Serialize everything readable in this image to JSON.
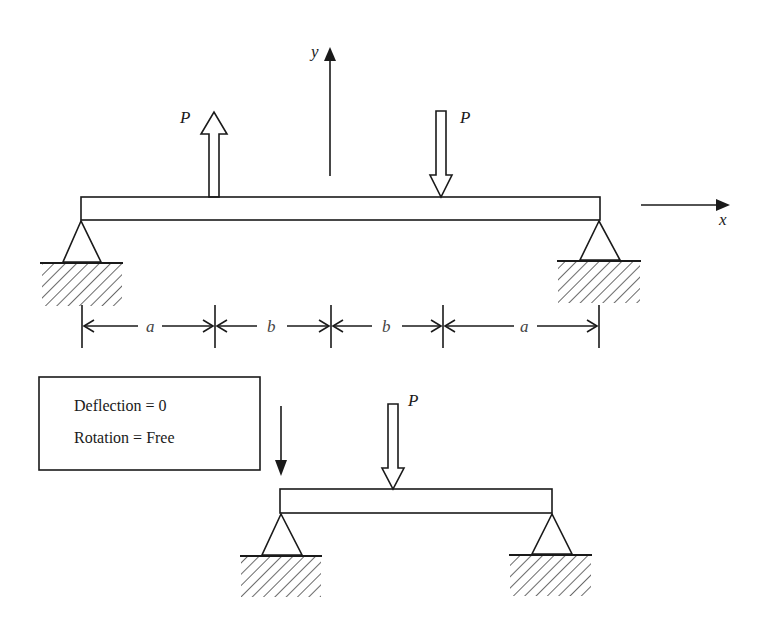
{
  "diagram": {
    "axes": {
      "y_label": "y",
      "x_label": "x"
    },
    "top_beam": {
      "load_left": {
        "label": "P",
        "direction": "up"
      },
      "load_right": {
        "label": "P",
        "direction": "down"
      },
      "dimensions": [
        {
          "label": "a"
        },
        {
          "label": "b"
        },
        {
          "label": "b"
        },
        {
          "label": "a"
        }
      ]
    },
    "boundary_box": {
      "line1": "Deflection = 0",
      "line2": "Rotation = Free"
    },
    "bottom_beam": {
      "load": {
        "label": "P",
        "direction": "down"
      }
    },
    "colors": {
      "ink": "#1a1a1a",
      "background": "#ffffff"
    }
  }
}
